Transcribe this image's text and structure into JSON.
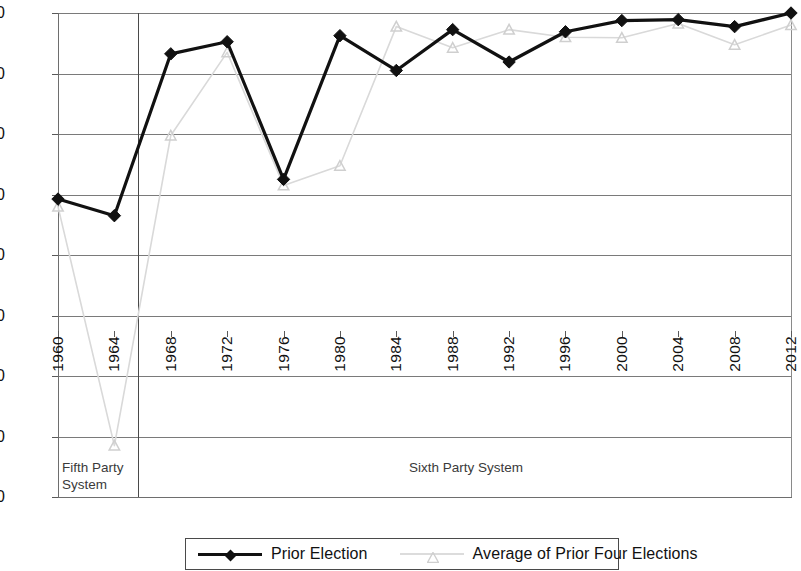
{
  "chart_data": {
    "type": "line",
    "title": "",
    "xlabel": "",
    "ylabel": "",
    "x": [
      1960,
      1964,
      1968,
      1972,
      1976,
      1980,
      1984,
      1988,
      1992,
      1996,
      2000,
      2004,
      2008,
      2012
    ],
    "xtick_labels": [
      "1960",
      "1964",
      "1968",
      "1972",
      "1976",
      "1980",
      "1984",
      "1988",
      "1992",
      "1996",
      "2000",
      "2004",
      "2008",
      "2012"
    ],
    "ytick_labels": [
      "1.00",
      "0.80",
      "0.60",
      "0.40",
      "0.20",
      "0.00",
      "-0.20",
      "-0.40",
      "-0.60"
    ],
    "ytick_values": [
      1.0,
      0.8,
      0.6,
      0.4,
      0.2,
      0.0,
      -0.2,
      -0.4,
      -0.6
    ],
    "ylim": [
      -0.6,
      1.0
    ],
    "grid": true,
    "legend_position": "bottom",
    "series": [
      {
        "name": "Prior Election",
        "color": "#111111",
        "marker": "diamond",
        "values": [
          0.385,
          0.33,
          0.865,
          0.905,
          0.45,
          0.925,
          0.81,
          0.945,
          0.838,
          0.938,
          0.975,
          0.978,
          0.955,
          1.0
        ]
      },
      {
        "name": "Average of Prior Four Elections",
        "color": "#d9d9d9",
        "marker": "triangle",
        "values": [
          0.36,
          -0.43,
          0.595,
          0.87,
          0.43,
          0.495,
          0.955,
          0.885,
          0.945,
          0.92,
          0.918,
          0.965,
          0.895,
          0.96
        ]
      }
    ],
    "annotations": [
      {
        "text": "Fifth Party System",
        "region_start": 1960,
        "region_end": 1964
      },
      {
        "text": "Sixth Party System",
        "region_start": 1968,
        "region_end": 2012
      }
    ],
    "era_divider_after": 1964
  },
  "annotations": {
    "fifth_party_line1": "Fifth Party",
    "fifth_party_line2": "System",
    "sixth_party": "Sixth Party System"
  },
  "legend": {
    "entries": [
      {
        "label": "Prior Election"
      },
      {
        "label": "Average of Prior Four Elections"
      }
    ]
  }
}
